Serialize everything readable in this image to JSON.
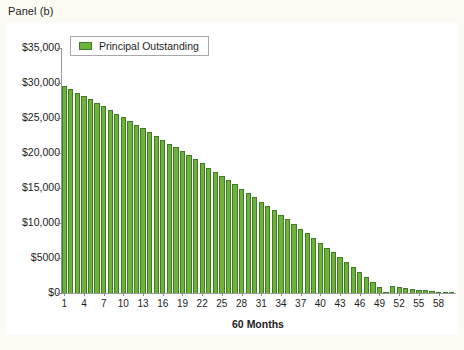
{
  "figure": {
    "panel_label": "Panel (b)",
    "background_color": "#fbfbf4",
    "panel_background_color": "#ffffff"
  },
  "legend": {
    "entries": [
      {
        "label": "Principal Outstanding",
        "color": "#6db33a"
      }
    ],
    "position": "top-left-inside"
  },
  "chart_data": {
    "type": "bar",
    "title": "Panel (b)",
    "xlabel": "60 Months",
    "ylabel": "",
    "ylim": [
      0,
      35000
    ],
    "xlim": [
      0.5,
      60.5
    ],
    "grid": false,
    "bar_color": "#6db33a",
    "bar_edge_color": "#3f7a28",
    "y_tick_labels": [
      "$0",
      "$5000",
      "$10,000",
      "$15,000",
      "$20,000",
      "$25,000",
      "$30,000",
      "$35,000"
    ],
    "y_tick_values": [
      0,
      5000,
      10000,
      15000,
      20000,
      25000,
      30000,
      35000
    ],
    "x_tick_labels": [
      "1",
      "4",
      "7",
      "10",
      "13",
      "16",
      "19",
      "22",
      "25",
      "28",
      "31",
      "34",
      "37",
      "40",
      "43",
      "46",
      "49",
      "52",
      "55",
      "58"
    ],
    "x_tick_values": [
      1,
      4,
      7,
      10,
      13,
      16,
      19,
      22,
      25,
      28,
      31,
      34,
      37,
      40,
      43,
      46,
      49,
      52,
      55,
      58
    ],
    "categories": [
      1,
      2,
      3,
      4,
      5,
      6,
      7,
      8,
      9,
      10,
      11,
      12,
      13,
      14,
      15,
      16,
      17,
      18,
      19,
      20,
      21,
      22,
      23,
      24,
      25,
      26,
      27,
      28,
      29,
      30,
      31,
      32,
      33,
      34,
      35,
      36,
      37,
      38,
      39,
      40,
      41,
      42,
      43,
      44,
      45,
      46,
      47,
      48,
      49,
      50,
      51,
      52,
      53,
      54,
      55,
      56,
      57,
      58,
      59,
      60
    ],
    "series": [
      {
        "name": "Principal Outstanding",
        "values": [
          29590,
          29110,
          28630,
          28140,
          27650,
          27150,
          26650,
          26140,
          25630,
          25110,
          24590,
          24060,
          23530,
          22990,
          22450,
          21900,
          21350,
          20790,
          20230,
          19660,
          19090,
          18510,
          17930,
          17340,
          16750,
          16150,
          15540,
          14930,
          14320,
          13700,
          13070,
          12440,
          11800,
          11160,
          10510,
          9860,
          9200,
          8530,
          7860,
          7180,
          6500,
          5810,
          5120,
          4420,
          3710,
          3000,
          2290,
          1570,
          840,
          100,
          980,
          860,
          740,
          620,
          500,
          400,
          300,
          200,
          120,
          40
        ]
      }
    ]
  }
}
